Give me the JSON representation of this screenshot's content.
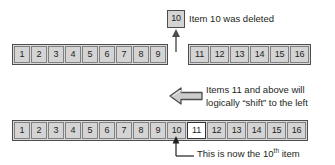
{
  "diagram": {
    "colors": {
      "cell_fill": "#d4d4d4",
      "row_fill": "#d9d9d9",
      "row_border": "#4d4d4d",
      "cell_border": "#808080",
      "highlight_fill": "#ffffff",
      "text": "#231f20",
      "arrow_fill": "#cccccc",
      "arrow_border": "#4d4d4d"
    },
    "deleted_item": {
      "label": "10",
      "caption": "Item 10 was deleted"
    },
    "top_row": {
      "left_group": [
        "1",
        "2",
        "3",
        "4",
        "5",
        "6",
        "7",
        "8",
        "9"
      ],
      "right_group": [
        "11",
        "12",
        "13",
        "14",
        "15",
        "16"
      ]
    },
    "shift_note": {
      "line1": "Items 11 and above will",
      "line2": "logically “shift” to the left",
      "arrow_icon": "left-block-arrow"
    },
    "bottom_row": {
      "cells": [
        "1",
        "2",
        "3",
        "4",
        "5",
        "6",
        "7",
        "8",
        "9",
        "10",
        "11",
        "12",
        "13",
        "14",
        "15",
        "16"
      ],
      "highlighted_value": "11"
    },
    "bottom_note": {
      "prefix": "This is now the 10",
      "ordinal_suffix": "th",
      "suffix": " item"
    }
  }
}
